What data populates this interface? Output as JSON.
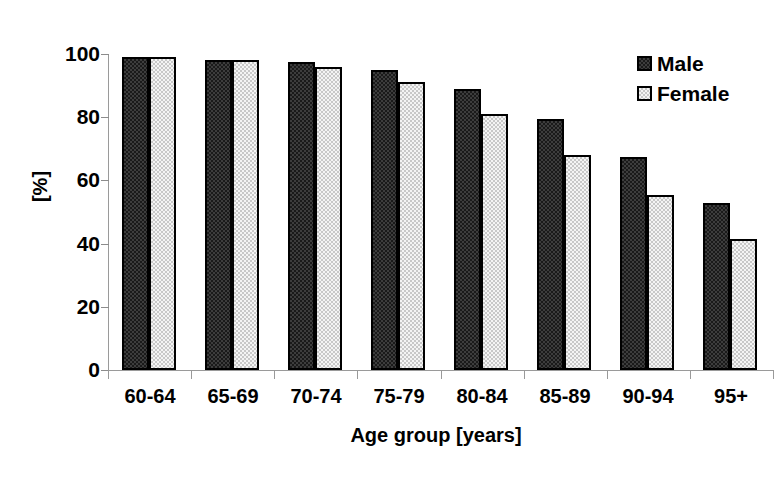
{
  "chart_data": {
    "type": "bar",
    "title": "",
    "subtitle": "",
    "xlabel": "Age group [years]",
    "ylabel": "[%]",
    "categories": [
      "60-64",
      "65-69",
      "70-74",
      "75-79",
      "80-84",
      "85-89",
      "90-94",
      "95+"
    ],
    "series": [
      {
        "name": "Male",
        "values": [
          99,
          98,
          97.5,
          95,
          89,
          79.5,
          67.5,
          53
        ]
      },
      {
        "name": "Female",
        "values": [
          99,
          98,
          96,
          91,
          81,
          68,
          55.5,
          41.5
        ]
      }
    ],
    "ylim": [
      0,
      100
    ],
    "yticks": [
      0,
      20,
      40,
      60,
      80,
      100
    ],
    "grid": false,
    "legend_position": "top-right",
    "legend_entries": [
      "Male",
      "Female"
    ],
    "colors": {
      "male_fill": "#3d3d3d",
      "female_fill": "#f4f4f4",
      "bar_border": "#000000",
      "axis": "#9a9a9a",
      "text": "#000000",
      "background": "#ffffff"
    }
  }
}
